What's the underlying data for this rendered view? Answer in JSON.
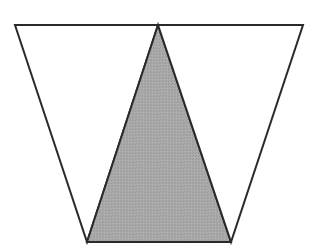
{
  "diagram": {
    "colors": {
      "background": "#ffffff",
      "stroke": "#2a2a2a",
      "shaded_fill": "#a8a8a8",
      "unshaded_fill": "#ffffff"
    },
    "stroke_width": 2,
    "vertices": {
      "top_left": [
        15,
        25
      ],
      "top_middle": [
        158,
        25
      ],
      "top_right": [
        303,
        25
      ],
      "bottom_left": [
        87,
        242
      ],
      "bottom_right": [
        231,
        242
      ]
    },
    "shapes": [
      {
        "name": "left-triangle",
        "points": [
          "top_left",
          "top_middle",
          "bottom_left"
        ],
        "shaded": false
      },
      {
        "name": "center-triangle",
        "points": [
          "top_middle",
          "bottom_right",
          "bottom_left"
        ],
        "shaded": true
      },
      {
        "name": "right-triangle",
        "points": [
          "top_middle",
          "top_right",
          "bottom_right"
        ],
        "shaded": false
      }
    ]
  }
}
